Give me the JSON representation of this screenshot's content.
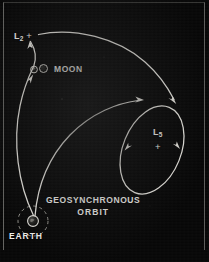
{
  "figure": {
    "background_color": "#070707",
    "line_color": "#e8e6e0",
    "text_color": "#efeeea"
  },
  "labels": {
    "l2": {
      "name": "L",
      "subscript": "2",
      "marker": "+"
    },
    "moon": {
      "text": "MOON",
      "glyph": "moon-symbol"
    },
    "l5": {
      "name": "L",
      "subscript": "5",
      "marker": "+"
    },
    "geosynchronous_orbit": {
      "line1": "GEOSYNCHRONOUS",
      "line2": "ORBIT"
    },
    "earth": {
      "text": "EARTH",
      "glyph": "earth-symbol"
    }
  },
  "chart_data": {
    "type": "diagram",
    "bodies": [
      {
        "id": "earth",
        "label": "EARTH",
        "x": 33,
        "y": 221,
        "radius": 5
      },
      {
        "id": "moon",
        "label": "MOON",
        "x": 34,
        "y": 70,
        "radius": 3.5
      },
      {
        "id": "l2",
        "label": "L2",
        "x": 31,
        "y": 35,
        "marker": "+"
      },
      {
        "id": "l5",
        "label": "L5",
        "x": 157,
        "y": 143,
        "marker": "+"
      }
    ],
    "orbits": [
      {
        "id": "geosynchronous-orbit",
        "label": "GEOSYNCHRONOUS ORBIT",
        "style": "dashed",
        "shape": "circle",
        "cx": 33,
        "cy": 221,
        "r": 15
      },
      {
        "id": "l5-libration-orbit",
        "label": "L5 orbit",
        "style": "solid",
        "shape": "ellipse",
        "cx": 152,
        "cy": 150,
        "rx": 29,
        "ry": 46,
        "rotation_deg": 22,
        "arrow_count": 2
      }
    ],
    "trajectories": [
      {
        "id": "earth-to-l2",
        "from": "EARTH",
        "to": "L2",
        "arrow_count": 2,
        "direction": "outbound"
      },
      {
        "id": "l2-to-l5",
        "from": "L2",
        "to": "L5 orbit",
        "arrow_count": 1,
        "direction": "outbound"
      },
      {
        "id": "earth-to-l5",
        "from": "EARTH",
        "to": "L5 orbit",
        "arrow_count": 1,
        "direction": "outbound"
      }
    ]
  }
}
